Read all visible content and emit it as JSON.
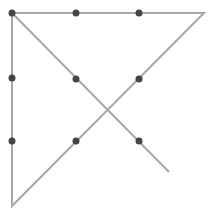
{
  "diagram": {
    "line_color": "#a9a9a9",
    "dot_color": "#444444",
    "dots": [
      {
        "x": 12,
        "y": 13
      },
      {
        "x": 76,
        "y": 13
      },
      {
        "x": 139,
        "y": 13
      },
      {
        "x": 12,
        "y": 78
      },
      {
        "x": 76,
        "y": 79
      },
      {
        "x": 139,
        "y": 79
      },
      {
        "x": 12,
        "y": 141
      },
      {
        "x": 76,
        "y": 141
      },
      {
        "x": 139,
        "y": 141
      }
    ],
    "path": [
      {
        "x": 169,
        "y": 172
      },
      {
        "x": 12,
        "y": 13
      },
      {
        "x": 204,
        "y": 13
      },
      {
        "x": 12,
        "y": 206
      },
      {
        "x": 12,
        "y": 13
      }
    ]
  }
}
